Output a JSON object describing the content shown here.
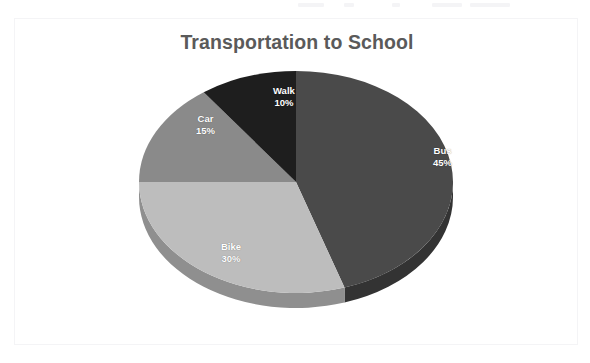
{
  "page": {
    "background_color": "#ffffff",
    "frame_border_color": "#f4f4f6"
  },
  "chart_title": "Transportation to School",
  "title_color": "#5a5a5a",
  "chart_data": {
    "type": "pie",
    "title": "Transportation to School",
    "xlabel": "",
    "ylabel": "",
    "legend": "none",
    "grid": false,
    "three_d": true,
    "start_angle_deg": 0,
    "direction": "clockwise",
    "units": "percent",
    "total": 100,
    "categories": [
      "Bus",
      "Bike",
      "Car",
      "Walk"
    ],
    "values": [
      45,
      30,
      15,
      10
    ],
    "slices": [
      {
        "label": "Bus",
        "value": 45,
        "percent_text": "45%",
        "color": "#4a4a4a",
        "side_color": "#333333",
        "start_deg": 0,
        "end_deg": 162,
        "label_x": 418,
        "label_y": 126
      },
      {
        "label": "Bike",
        "value": 30,
        "percent_text": "30%",
        "color": "#bdbdbd",
        "side_color": "#8f8f8f",
        "start_deg": 162,
        "end_deg": 270,
        "label_x": 206,
        "label_y": 222
      },
      {
        "label": "Car",
        "value": 15,
        "percent_text": "15%",
        "color": "#8a8a8a",
        "side_color": "#6a6a6a",
        "start_deg": 270,
        "end_deg": 324,
        "label_x": 181,
        "label_y": 94
      },
      {
        "label": "Walk",
        "value": 10,
        "percent_text": "10%",
        "color": "#1e1e1e",
        "side_color": "#141414",
        "start_deg": 324,
        "end_deg": 360,
        "label_x": 258,
        "label_y": 66
      }
    ],
    "geometry": {
      "center_x": 281,
      "center_y": 163,
      "radius_x": 157,
      "radius_y": 111,
      "depth": 15
    }
  }
}
